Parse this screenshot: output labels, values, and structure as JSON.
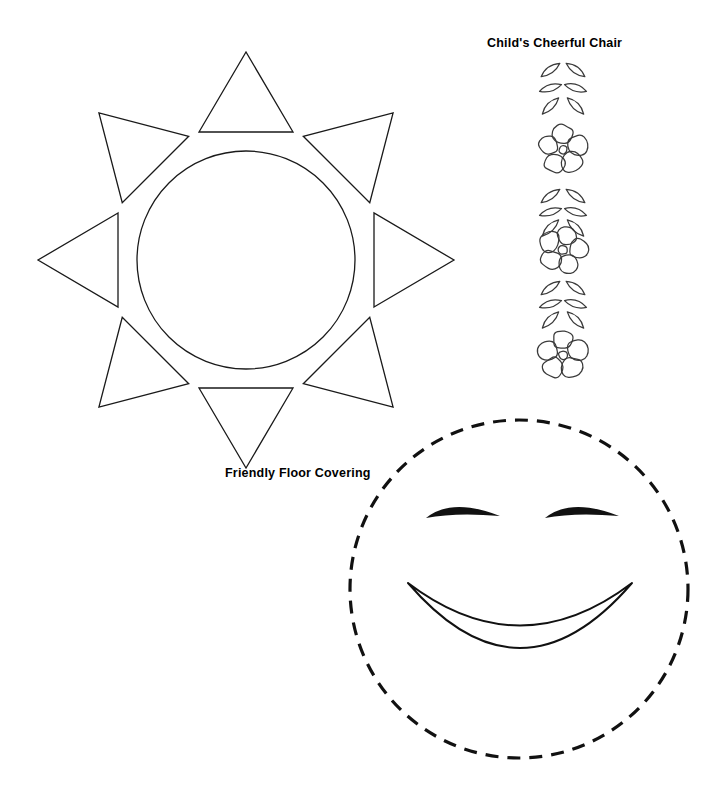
{
  "page": {
    "kind": "craft-pattern-sheet",
    "background_color": "#ffffff",
    "ink_color": "#1a1a1a",
    "width": 727,
    "height": 790
  },
  "captions": {
    "chair": "Child's Cheerful Chair",
    "floor": "Friendly Floor Covering"
  },
  "patterns": {
    "sun": {
      "name": "sun-pattern",
      "circle": {
        "cx": 246,
        "cy": 260,
        "r": 109
      },
      "rays": {
        "count": 8,
        "base_radius": 128,
        "length": 80,
        "half_width": 47,
        "angles_deg": [
          270,
          315,
          0,
          45,
          90,
          135,
          180,
          225
        ]
      }
    },
    "floral_strip": {
      "name": "floral-vine-strip",
      "bounds": {
        "x": 534,
        "y": 58,
        "width": 58,
        "height": 322
      },
      "flower_centers_y": [
        150,
        250,
        355
      ],
      "petals_per_flower": 5,
      "leaf_rows_y": [
        70,
        88,
        106,
        196,
        212,
        228,
        288,
        304,
        320
      ]
    },
    "smiley": {
      "name": "smiley-face-pattern",
      "face": {
        "cx": 519,
        "cy": 589,
        "r": 169,
        "stroke_style": "dashed"
      },
      "eyes": [
        {
          "side": "left",
          "cx": 463,
          "cy": 518,
          "half_width": 37,
          "arc": 17,
          "thickness": 11
        },
        {
          "side": "right",
          "cx": 582,
          "cy": 518,
          "half_width": 37,
          "arc": 17,
          "thickness": 11
        }
      ],
      "mouth": {
        "cx": 520,
        "cy": 600,
        "half_width": 112,
        "top_dip": 68,
        "bottom_dip": 113
      }
    }
  }
}
